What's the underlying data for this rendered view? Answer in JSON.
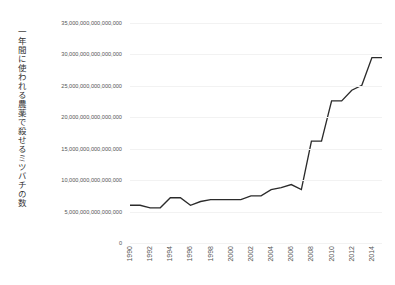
{
  "chart_data": {
    "type": "line",
    "title": "",
    "xlabel": "",
    "ylabel": "一年間に使われる農薬で殺せるミツバチの数",
    "ylim": [
      0,
      35000000000000000
    ],
    "xlim": [
      1990,
      2015
    ],
    "grid": true,
    "legend": false,
    "y_tick_labels": [
      "35,000,000,000,000,000",
      "30,000,000,000,000,000",
      "25,000,000,000,000,000",
      "20,000,000,000,000,000",
      "15,000,000,000,000,000",
      "10,000,000,000,000,000",
      "5,000,000,000,000,000",
      "0"
    ],
    "y_tick_values": [
      35000000000000000,
      30000000000000000,
      25000000000000000,
      20000000000000000,
      15000000000000000,
      10000000000000000,
      5000000000000000,
      0
    ],
    "x_tick_labels": [
      "1990",
      "1992",
      "1994",
      "1996",
      "1998",
      "2000",
      "2002",
      "2004",
      "2006",
      "2008",
      "2010",
      "2012",
      "2014"
    ],
    "x_tick_values": [
      1990,
      1992,
      1994,
      1996,
      1998,
      2000,
      2002,
      2004,
      2006,
      2008,
      2010,
      2012,
      2014
    ],
    "x": [
      1990,
      1991,
      1992,
      1993,
      1994,
      1995,
      1996,
      1997,
      1998,
      1999,
      2000,
      2001,
      2002,
      2003,
      2004,
      2005,
      2006,
      2007,
      2008,
      2009,
      2010,
      2011,
      2012,
      2013,
      2014,
      2015
    ],
    "values": [
      6000000000000000,
      6000000000000000,
      5600000000000000,
      5600000000000000,
      7200000000000000,
      7200000000000000,
      6000000000000000,
      6600000000000000,
      6900000000000000,
      6900000000000000,
      6900000000000000,
      6900000000000000,
      7500000000000000,
      7500000000000000,
      8500000000000000,
      8800000000000000,
      9300000000000000,
      8500000000000000,
      16200000000000000,
      16200000000000000,
      22600000000000000,
      22600000000000000,
      24300000000000000,
      25100000000000000,
      29500000000000000,
      29500000000000000
    ],
    "series_color": "#2b2b2b",
    "gridline_color": "#f2f2f2",
    "background_color": "#ffffff"
  }
}
